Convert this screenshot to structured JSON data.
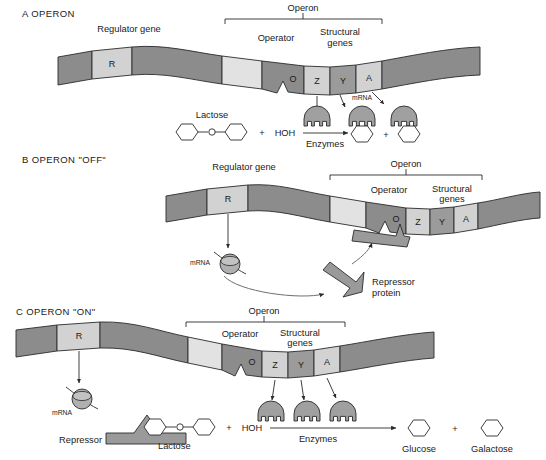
{
  "figure": {
    "panels": [
      {
        "id": "A",
        "label": "A   OPERON",
        "letter": "A",
        "title": "OPERON",
        "brackets": [
          {
            "label": "Operon"
          }
        ],
        "dna_labels": {
          "regulator_gene": "Regulator gene",
          "operator": "Operator",
          "structural_genes_line1": "Structural",
          "structural_genes_line2": "genes"
        },
        "gene_boxes": [
          {
            "letter": "R",
            "name": "regulator"
          },
          {
            "letter": "O",
            "name": "operator"
          },
          {
            "letter": "Z",
            "name": "structural-z"
          },
          {
            "letter": "Y",
            "name": "structural-y"
          },
          {
            "letter": "A",
            "name": "structural-a"
          }
        ],
        "mrna_label": "mRNA",
        "reaction": {
          "substrate": "Lactose",
          "plus1": "+",
          "water": "HOH",
          "catalyst": "Enzymes",
          "plus2": "+"
        }
      },
      {
        "id": "B",
        "label": "B   OPERON \"OFF\"",
        "letter": "B",
        "title": "OPERON \"OFF\"",
        "brackets": [
          {
            "label": "Operon"
          }
        ],
        "dna_labels": {
          "regulator_gene": "Regulator gene",
          "operator": "Operator",
          "structural_genes_line1": "Structural",
          "structural_genes_line2": "genes"
        },
        "gene_boxes": [
          {
            "letter": "R",
            "name": "regulator"
          },
          {
            "letter": "O",
            "name": "operator"
          },
          {
            "letter": "Z",
            "name": "structural-z"
          },
          {
            "letter": "Y",
            "name": "structural-y"
          },
          {
            "letter": "A",
            "name": "structural-a"
          }
        ],
        "mrna_label": "mRNA",
        "repressor_line1": "Repressor",
        "repressor_line2": "protein"
      },
      {
        "id": "C",
        "label": "C   OPERON \"ON\"",
        "letter": "C",
        "title": "OPERON \"ON\"",
        "brackets": [
          {
            "label": "Operon"
          }
        ],
        "dna_labels": {
          "operator": "Operator",
          "structural_genes_line1": "Structural",
          "structural_genes_line2": "genes"
        },
        "gene_boxes": [
          {
            "letter": "R",
            "name": "regulator"
          },
          {
            "letter": "O",
            "name": "operator"
          },
          {
            "letter": "Z",
            "name": "structural-z"
          },
          {
            "letter": "Y",
            "name": "structural-y"
          },
          {
            "letter": "A",
            "name": "structural-a"
          }
        ],
        "mrna_label": "mRNA",
        "reaction": {
          "repressor": "Repressor",
          "substrate": "Lactose",
          "plus1": "+",
          "water": "HOH",
          "catalyst": "Enzymes",
          "product1": "Glucose",
          "plus2": "+",
          "product2": "Galactose"
        }
      }
    ]
  },
  "colors": {
    "dna_dark": "#8c8c8c",
    "dna_light": "#e2e2e2",
    "dna_mid": "#b9b9b9",
    "stroke": "#2a2a2a",
    "enzyme_fill": "#a0a0a0",
    "ribosome_fill": "#b0b0b0",
    "repressor_fill": "#9a9a9a",
    "background": "#ffffff",
    "text": "#1a1a1a"
  }
}
